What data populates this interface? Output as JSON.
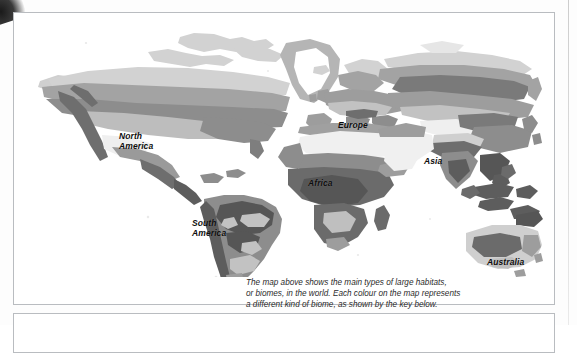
{
  "page": {
    "background": "#fdfdfd",
    "frame_color": "#b9bcc0"
  },
  "map": {
    "title_alt": "World biomes map",
    "continent_labels": [
      {
        "id": "north-america",
        "text": "North\nAmerica"
      },
      {
        "id": "south-america",
        "text": "South\nAmerica"
      },
      {
        "id": "europe",
        "text": "Europe"
      },
      {
        "id": "asia",
        "text": "Asia"
      },
      {
        "id": "africa",
        "text": "Africa"
      },
      {
        "id": "australia",
        "text": "Australia"
      }
    ],
    "biome_colors": {
      "ocean": "#ffffff",
      "ice_tundra": "#e6e6e6",
      "tundra_light": "#d2d2d2",
      "taiga_mid": "#a8a8a8",
      "temperate": "#8f8f8f",
      "grassland": "#bdbdbd",
      "desert": "#f1f1f1",
      "scrub": "#9a9a9a",
      "tropical_dark": "#6f6f6f",
      "rainforest_darkest": "#5a5a5a",
      "mountain": "#7a7a7a"
    }
  },
  "caption": {
    "line1": "The map above shows the main types of large habitats,",
    "line2": "or biomes, in the world. Each colour on the map represents",
    "line3": "a different kind of biome, as shown by the key below."
  }
}
